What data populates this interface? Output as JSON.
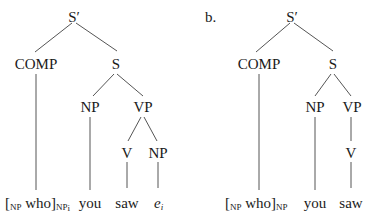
{
  "diagram": {
    "type": "syntax-trees",
    "tree_a": {
      "label": "",
      "nodes": {
        "root": "S′",
        "comp": "COMP",
        "s": "S",
        "np_subject": "NP",
        "vp": "VP",
        "v": "V",
        "np_object": "NP"
      },
      "leaves": {
        "comp_open": "[",
        "comp_open_sub": "NP",
        "comp_word": " who]",
        "comp_close_sub": "NP",
        "comp_index": "i",
        "subject": "you",
        "verb": "saw",
        "trace": "e",
        "trace_index": "i"
      }
    },
    "tree_b": {
      "label": "b.",
      "nodes": {
        "root": "S′",
        "comp": "COMP",
        "s": "S",
        "np_subject": "NP",
        "vp": "VP",
        "v": "V"
      },
      "leaves": {
        "comp_open": "[",
        "comp_open_sub": "NP",
        "comp_word": " who]",
        "comp_close_sub": "NP",
        "subject": "you",
        "verb": "saw"
      }
    },
    "colors": {
      "text": "#1a1a1a",
      "lines": "#555555",
      "background": "#ffffff"
    }
  }
}
